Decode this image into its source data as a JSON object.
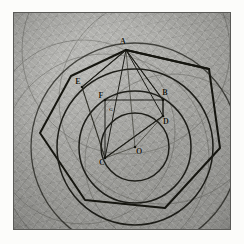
{
  "plate": {
    "title": "Geometric construction plate",
    "media": "engraving",
    "background_color": "#a8a8a4",
    "ink_color": "#1d1d18",
    "border_color": "#5a5a57"
  },
  "labels": [
    {
      "id": "A",
      "text": "A",
      "x": 110,
      "y": 30,
      "size": "big",
      "anchor_x": 113,
      "anchor_y": 38
    },
    {
      "id": "B",
      "text": "B",
      "x": 152,
      "y": 81,
      "size": "big",
      "anchor_x": 150,
      "anchor_y": 88
    },
    {
      "id": "C",
      "text": "C",
      "x": 89,
      "y": 151,
      "size": "big",
      "anchor_x": 92,
      "anchor_y": 146
    },
    {
      "id": "D",
      "text": "D",
      "x": 153,
      "y": 110,
      "size": "big",
      "anchor_x": 150,
      "anchor_y": 104
    },
    {
      "id": "E",
      "text": "E",
      "x": 65,
      "y": 70,
      "size": "big",
      "anchor_x": 69,
      "anchor_y": 75
    },
    {
      "id": "F",
      "text": "F",
      "x": 88,
      "y": 84,
      "size": "big",
      "anchor_x": 92,
      "anchor_y": 88
    },
    {
      "id": "G",
      "text": "G",
      "x": 98,
      "y": 97,
      "size": "small",
      "anchor_x": 99,
      "anchor_y": 97
    },
    {
      "id": "O",
      "text": "O",
      "x": 126,
      "y": 140,
      "size": "big",
      "anchor_x": 122,
      "anchor_y": 135
    }
  ],
  "geometry": {
    "center": {
      "x": 122,
      "y": 135
    },
    "circles": [
      {
        "name": "inner-circle",
        "cx": 122,
        "cy": 135,
        "r": 34
      },
      {
        "name": "second-circle",
        "cx": 122,
        "cy": 135,
        "r": 56
      },
      {
        "name": "third-circle",
        "cx": 122,
        "cy": 135,
        "r": 78
      },
      {
        "name": "outer-circle",
        "cx": 122,
        "cy": 135,
        "r": 104
      }
    ],
    "construction_arcs": [
      {
        "name": "arc-from-A",
        "cx": 113,
        "cy": 38,
        "r": 104
      },
      {
        "name": "arc-from-B",
        "cx": 150,
        "cy": 88,
        "r": 104
      },
      {
        "name": "arc-from-C",
        "cx": 92,
        "cy": 146,
        "r": 104
      },
      {
        "name": "arc-faint-1",
        "cx": 70,
        "cy": 120,
        "r": 92
      },
      {
        "name": "arc-faint-2",
        "cx": 160,
        "cy": 150,
        "r": 88
      }
    ],
    "polygon_outer": [
      [
        113,
        38
      ],
      [
        196,
        57
      ],
      [
        207,
        136
      ],
      [
        152,
        196
      ],
      [
        72,
        188
      ],
      [
        27,
        121
      ],
      [
        58,
        64
      ]
    ],
    "inner_polygon": [
      [
        113,
        38
      ],
      [
        150,
        88
      ],
      [
        150,
        104
      ],
      [
        92,
        146
      ],
      [
        69,
        75
      ]
    ],
    "chords": [
      {
        "name": "chord-A-B",
        "x1": 113,
        "y1": 38,
        "x2": 150,
        "y2": 88
      },
      {
        "name": "chord-A-C",
        "x1": 113,
        "y1": 38,
        "x2": 92,
        "y2": 146
      },
      {
        "name": "chord-A-D",
        "x1": 113,
        "y1": 38,
        "x2": 150,
        "y2": 104
      },
      {
        "name": "chord-A-E",
        "x1": 113,
        "y1": 38,
        "x2": 69,
        "y2": 75
      },
      {
        "name": "chord-B-D",
        "x1": 150,
        "y1": 88,
        "x2": 150,
        "y2": 104
      },
      {
        "name": "chord-C-D",
        "x1": 92,
        "y1": 146,
        "x2": 150,
        "y2": 104
      },
      {
        "name": "chord-C-F",
        "x1": 92,
        "y1": 146,
        "x2": 92,
        "y2": 88
      },
      {
        "name": "chord-F-B",
        "x1": 92,
        "y1": 88,
        "x2": 150,
        "y2": 88
      },
      {
        "name": "radius-O-D",
        "x1": 122,
        "y1": 135,
        "x2": 150,
        "y2": 104
      },
      {
        "name": "radius-O-C",
        "x1": 122,
        "y1": 135,
        "x2": 92,
        "y2": 146
      },
      {
        "name": "radius-O-A",
        "x1": 122,
        "y1": 135,
        "x2": 113,
        "y2": 38
      }
    ]
  }
}
